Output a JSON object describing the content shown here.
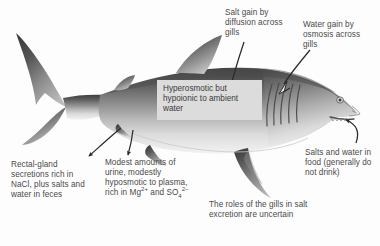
{
  "figure": {
    "background_color": "#fdfdfd",
    "text_color": "#4a4a4a"
  },
  "callout": {
    "text": "Hyperosmotic but hypoionic to ambient water",
    "background_color": "#dcdcdc"
  },
  "labels": {
    "salt_gain": "Salt gain by diffusion across gills",
    "water_gain": "Water gain by osmosis across gills",
    "rectal_gland": "Rectal-gland secretions rich in NaCl, plus salts and water in feces",
    "urine_prefix": "Modest amounts of urine, modestly hyposmotic to plasma, rich in Mg",
    "urine_mg_charge": "2+",
    "urine_mid": " and SO",
    "urine_so4_sub": "4",
    "urine_so4_charge": "2–",
    "salts_in_food": "Salts and water in food (generally do not drink)",
    "gill_roles": "The roles of the gills in salt excretion are uncertain"
  },
  "arrows": {
    "salt_gain_arrow": "solid-arrow-icon",
    "water_gain_arrow": "hollow-arrow-icon",
    "rectal_gland_arrow": "curved-arrow-icon",
    "urine_arrow": "curved-arrow-icon",
    "food_arrow": "curved-arrow-icon"
  },
  "shark": {
    "name": "shark-illustration",
    "parts": [
      "caudal-fin",
      "dorsal-fin",
      "second-dorsal-fin",
      "pectoral-fin",
      "pelvic-fin",
      "anal-fin",
      "gill-slits",
      "eye",
      "mouth",
      "snout"
    ]
  }
}
